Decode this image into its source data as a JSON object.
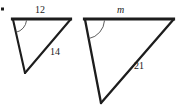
{
  "figure": {
    "kind": "similar-triangles-diagram",
    "bullet": {
      "name": "bullet-marker",
      "x": 2,
      "y": 8,
      "size": 3
    },
    "stroke_color": "#1d1d1d",
    "background_color": "#ffffff",
    "triangles": [
      {
        "id": "left-triangle",
        "name": "small-triangle",
        "vertices": {
          "top_left": [
            13,
            19
          ],
          "top_right": [
            70,
            19
          ],
          "bottom": [
            25,
            73
          ]
        },
        "angle_arc": {
          "vertex": "top_left",
          "radius": 13
        },
        "side_labels": [
          {
            "id": "label-12",
            "name": "side-label-top-12",
            "text": "12",
            "side": "top",
            "italic": false
          },
          {
            "id": "label-14",
            "name": "side-label-hypotenuse-14",
            "text": "14",
            "side": "right",
            "italic": false
          }
        ]
      },
      {
        "id": "right-triangle",
        "name": "large-triangle",
        "vertices": {
          "top_left": [
            85,
            19
          ],
          "top_right": [
            173,
            19
          ],
          "bottom": [
            101,
            103
          ]
        },
        "angle_arc": {
          "vertex": "top_left",
          "radius": 19
        },
        "side_labels": [
          {
            "id": "label-m",
            "name": "side-label-top-m",
            "text": "m",
            "side": "top",
            "italic": true
          },
          {
            "id": "label-21",
            "name": "side-label-hypotenuse-21",
            "text": "21",
            "side": "right",
            "italic": false
          }
        ]
      }
    ]
  },
  "labels": {
    "small_top": "12",
    "small_side": "14",
    "large_top": "m",
    "large_side": "21"
  }
}
